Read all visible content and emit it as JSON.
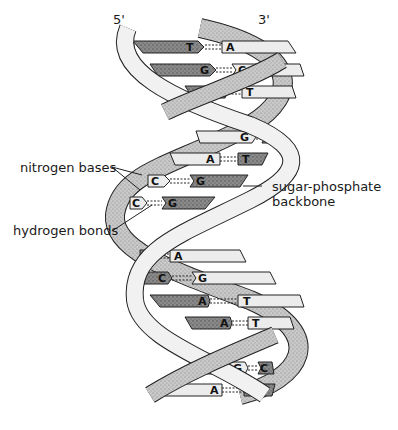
{
  "diagram": {
    "ends": {
      "left": "5'",
      "right": "3'"
    },
    "labels": {
      "nitrogen_bases": "nitrogen bases",
      "hydrogen_bonds": "hydrogen bonds",
      "backbone_line1": "sugar-phosphate",
      "backbone_line2": "backbone"
    },
    "base_pairs": [
      {
        "left": "T",
        "right": "A"
      },
      {
        "left": "G",
        "right": "C"
      },
      {
        "left": "A",
        "right": "T"
      },
      {
        "left": "G",
        "right": "C"
      },
      {
        "left": "A",
        "right": "T"
      },
      {
        "left": "C",
        "right": "G"
      },
      {
        "left": "C",
        "right": "G"
      },
      {
        "left": "T",
        "right": "A"
      },
      {
        "left": "C",
        "right": "G"
      },
      {
        "left": "A",
        "right": "T"
      },
      {
        "left": "A",
        "right": "T"
      },
      {
        "left": "G",
        "right": "C"
      },
      {
        "left": "A",
        "right": "T"
      }
    ],
    "colors": {
      "dark_base": "#6e6e6e",
      "light_base": "#e6e6e6",
      "backbone_light": "#efefef",
      "backbone_dark": "#bdbdbd",
      "outline": "#222222"
    }
  }
}
